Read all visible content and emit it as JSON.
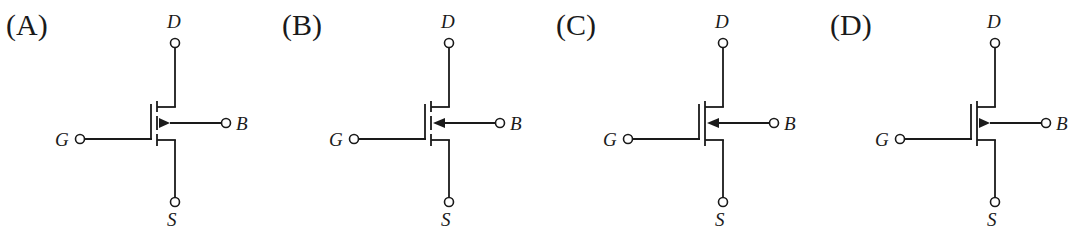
{
  "figure": {
    "options": [
      {
        "label": "(A)",
        "channel": "segmented",
        "arrow_direction": "outward",
        "terminals": {
          "drain": "D",
          "gate": "G",
          "source": "S",
          "body": "B"
        }
      },
      {
        "label": "(B)",
        "channel": "segmented",
        "arrow_direction": "inward",
        "terminals": {
          "drain": "D",
          "gate": "G",
          "source": "S",
          "body": "B"
        }
      },
      {
        "label": "(C)",
        "channel": "continuous",
        "arrow_direction": "inward",
        "terminals": {
          "drain": "D",
          "gate": "G",
          "source": "S",
          "body": "B"
        }
      },
      {
        "label": "(D)",
        "channel": "continuous",
        "arrow_direction": "outward",
        "terminals": {
          "drain": "D",
          "gate": "G",
          "source": "S",
          "body": "B"
        }
      }
    ],
    "colors": {
      "ink": "#1a1a1a",
      "background": "#ffffff"
    }
  }
}
